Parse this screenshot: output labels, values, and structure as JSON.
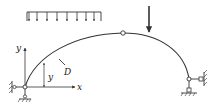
{
  "diagram": {
    "type": "three-hinged arch",
    "colors": {
      "line": "#333333",
      "background": "#ffffff"
    },
    "labels": {
      "x_axis": "x",
      "y_axis": "y",
      "y_dimension": "y",
      "point_D": "D"
    },
    "loads": {
      "distributed": {
        "arrow_count": 8
      },
      "concentrated": {
        "count": 1
      }
    },
    "hinges": [
      "left-support",
      "crown",
      "right-support"
    ]
  }
}
